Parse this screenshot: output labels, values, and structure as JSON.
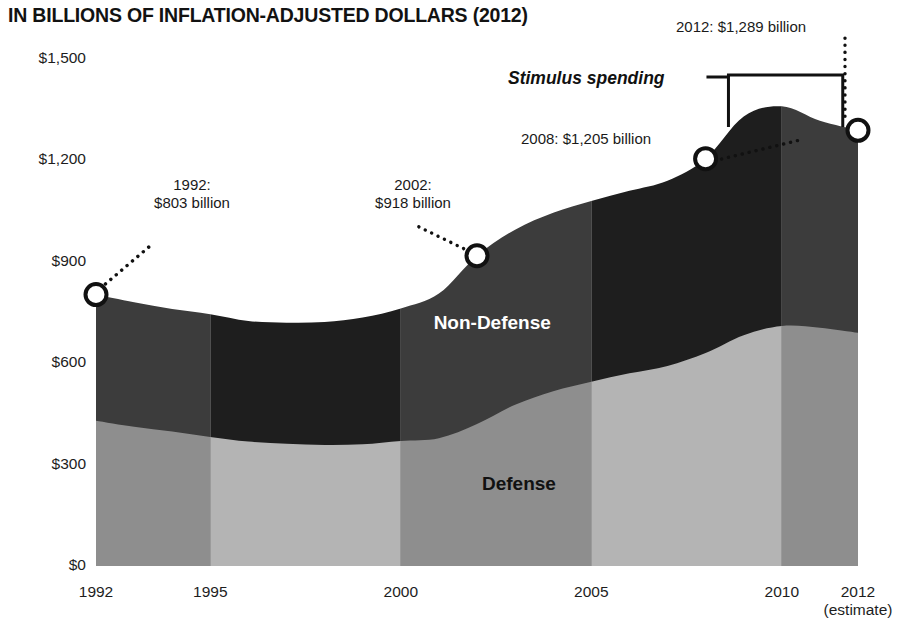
{
  "chart_data": {
    "type": "area",
    "stacked": true,
    "title": "IN BILLIONS OF INFLATION-ADJUSTED DOLLARS (2012)",
    "xlabel": "",
    "ylabel": "",
    "ylim": [
      0,
      1500
    ],
    "xlim": [
      1992,
      2012
    ],
    "grid": false,
    "legend_position": "inline-labels",
    "yticks": [
      0,
      300,
      600,
      900,
      1200,
      1500
    ],
    "ytick_labels": [
      "$0",
      "$300",
      "$600",
      "$900",
      "$1,200",
      "$1,500"
    ],
    "xticks": [
      1992,
      1995,
      2000,
      2005,
      2010,
      2012
    ],
    "xtick_labels": [
      "1992",
      "1995",
      "2000",
      "2005",
      "2010",
      "2012"
    ],
    "xtick_sublabels": [
      "",
      "",
      "",
      "",
      "",
      "(estimate)"
    ],
    "x": [
      1992,
      1993,
      1994,
      1995,
      1996,
      1997,
      1998,
      1999,
      2000,
      2001,
      2002,
      2003,
      2004,
      2005,
      2006,
      2007,
      2008,
      2009,
      2010,
      2011,
      2012
    ],
    "series": [
      {
        "name": "Defense",
        "color": "#9a9a9a",
        "values": [
          430,
          412,
          398,
          382,
          368,
          362,
          358,
          360,
          370,
          378,
          420,
          477,
          517,
          545,
          570,
          592,
          630,
          683,
          710,
          705,
          690
        ]
      },
      {
        "name": "Non-Defense",
        "color": "#2b2b2b",
        "values": [
          373,
          368,
          362,
          363,
          357,
          358,
          364,
          375,
          392,
          428,
          498,
          518,
          528,
          535,
          540,
          548,
          575,
          647,
          650,
          612,
          599
        ]
      }
    ],
    "totals": [
      803,
      780,
      760,
      745,
      725,
      720,
      722,
      735,
      762,
      806,
      918,
      995,
      1045,
      1080,
      1110,
      1140,
      1205,
      1330,
      1360,
      1317,
      1289
    ],
    "band_shading": {
      "description": "alternating vertical tone bands between x tick marks",
      "boundaries": [
        1992,
        1995,
        2000,
        2005,
        2010,
        2012
      ],
      "alternating": true
    }
  },
  "annotations": {
    "point_1992": {
      "label_line1": "1992:",
      "label_line2": "$803 billion",
      "year": 1992,
      "value": 803
    },
    "point_2002": {
      "label_line1": "2002:",
      "label_line2": "$918 billion",
      "year": 2002,
      "value": 918
    },
    "point_2008": {
      "label": "2008: $1,205 billion",
      "year": 2008,
      "value": 1205
    },
    "point_2012": {
      "label": "2012: $1,289 billion",
      "year": 2012,
      "value": 1289
    },
    "stimulus": {
      "label": "Stimulus spending",
      "span_start": 2008.6,
      "span_end": 2011.6
    }
  },
  "series_labels": {
    "nondefense": "Non-Defense",
    "defense": "Defense"
  },
  "colors": {
    "defense_light": "#b4b4b4",
    "defense_dark": "#8e8e8e",
    "nondefense_light": "#3c3c3c",
    "nondefense_dark": "#1e1e1e",
    "text": "#1a1a1a",
    "background": "#ffffff"
  }
}
